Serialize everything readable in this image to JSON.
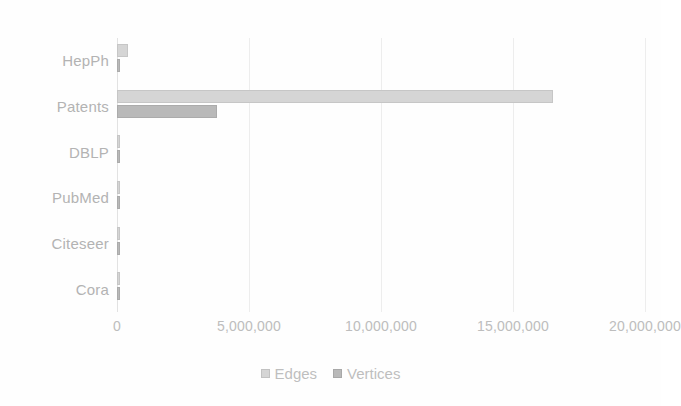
{
  "chart_data": {
    "type": "bar",
    "orientation": "horizontal",
    "title": "",
    "subtitle": "",
    "xlabel": "",
    "ylabel": "",
    "categories": [
      "HepPh",
      "Patents",
      "DBLP",
      "PubMed",
      "Citeseer",
      "Cora"
    ],
    "series": [
      {
        "name": "Edges",
        "color": "#d5d5d5",
        "values": [
          421578,
          16518948,
          105000,
          44338,
          4732,
          5429
        ]
      },
      {
        "name": "Vertices",
        "color": "#b9b9b9",
        "values": [
          34546,
          3774768,
          15000,
          19717,
          3327,
          2708
        ]
      }
    ],
    "xlim": [
      0,
      20000000
    ],
    "xticks": [
      0,
      5000000,
      10000000,
      15000000,
      20000000
    ],
    "xtick_labels": [
      "0",
      "5,000,000",
      "10,000,000",
      "15,000,000",
      "20,000,000"
    ],
    "grid": true,
    "grid_axis": "x",
    "legend": true,
    "legend_position": "bottom",
    "legend_entries": [
      "Edges",
      "Vertices"
    ],
    "background_color": "#fefefe",
    "gridline_color": "#ededed",
    "text_color": "#b8b8b8"
  }
}
